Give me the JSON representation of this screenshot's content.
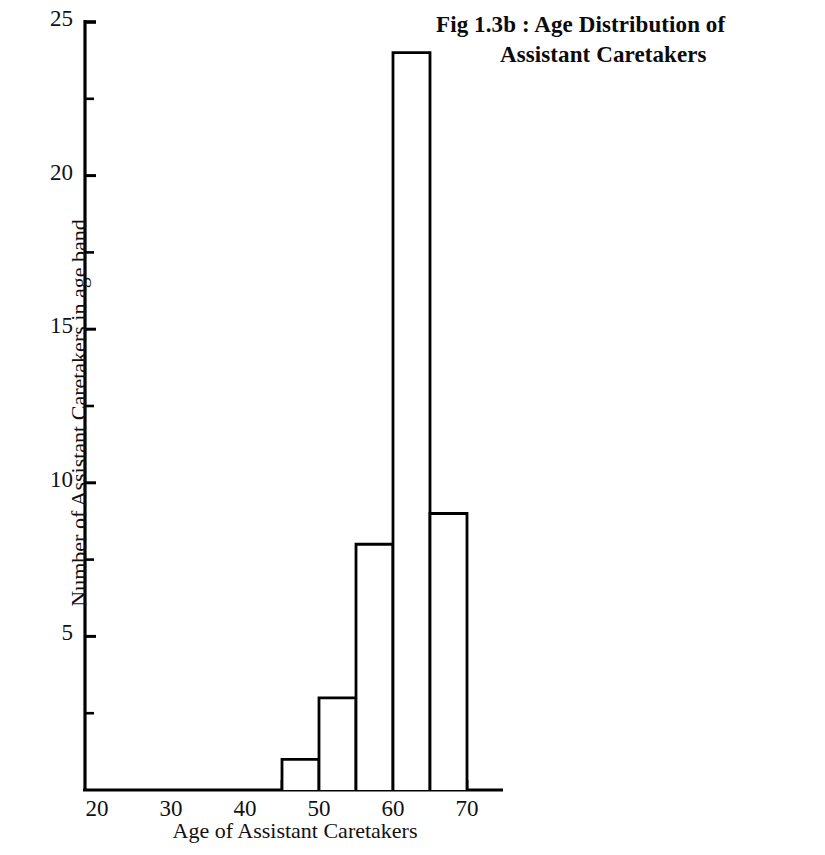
{
  "title": {
    "line1": "Fig 1.3b : Age Distribution of",
    "line2": "Assistant Caretakers"
  },
  "axes": {
    "xlabel": "Age of Assistant Caretakers",
    "ylabel": "Number of Assistant Caretakers in age band",
    "x_ticks": [
      "20",
      "30",
      "40",
      "50",
      "60",
      "70"
    ],
    "y_ticks": [
      "5",
      "10",
      "15",
      "20",
      "25"
    ]
  },
  "chart_data": {
    "type": "bar",
    "title": "Fig 1.3b : Age Distribution of Assistant Caretakers",
    "xlabel": "Age of Assistant Caretakers",
    "ylabel": "Number of Assistant Caretakers in age band",
    "categories": [
      "20-25",
      "25-30",
      "30-35",
      "35-40",
      "40-45",
      "45-50",
      "50-55",
      "55-60",
      "60-65",
      "65-70"
    ],
    "bin_edges": [
      20,
      25,
      30,
      35,
      40,
      45,
      50,
      55,
      60,
      65,
      70
    ],
    "values": [
      0,
      0,
      0,
      0,
      0,
      1,
      3,
      8,
      24,
      9
    ],
    "xlim": [
      20,
      72
    ],
    "ylim": [
      0,
      25
    ],
    "x_major_ticks": [
      20,
      30,
      40,
      50,
      60,
      70
    ],
    "x_minor_ticks": [
      45,
      50,
      55,
      60,
      65,
      70
    ],
    "y_major_ticks": [
      5,
      10,
      15,
      20,
      25
    ],
    "y_minor_ticks": [
      2.5,
      7.5,
      12.5,
      17.5,
      22.5
    ],
    "grid": false,
    "legend": null,
    "bar_fill": "#ffffff",
    "bar_stroke": "#000000",
    "axis_color": "#000000"
  }
}
